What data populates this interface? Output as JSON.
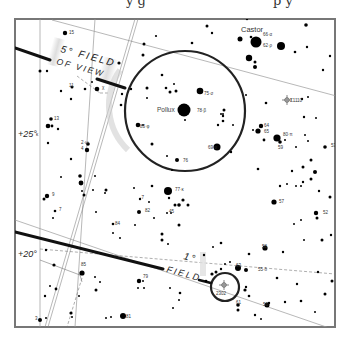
{
  "caption_fragment": {
    "left": "y g",
    "right": "p y"
  },
  "frame": {
    "x": 15,
    "y": 19,
    "width": 320,
    "height": 308,
    "border_color": "#777777"
  },
  "declination_labels": [
    {
      "label": "+25°",
      "x": 18,
      "y": 135
    },
    {
      "label": "+20°",
      "x": 18,
      "y": 255
    }
  ],
  "fov_labels": {
    "five_deg": {
      "line1": "5° FIELD",
      "line2": "OF VIEW"
    },
    "one_deg": {
      "line1": "1°",
      "line2": "FIELD"
    }
  },
  "circles": {
    "five_deg": {
      "cx": 185,
      "cy": 111,
      "r": 60,
      "color": "#222222"
    },
    "one_deg": {
      "cx": 225,
      "cy": 287,
      "r": 14,
      "color": "#222222"
    }
  },
  "named_stars": [
    {
      "name": "Castor",
      "id": "66-α",
      "x": 256,
      "y": 42,
      "r": 5.5
    },
    {
      "name": "Pollux",
      "id": "78-β",
      "x": 184,
      "y": 110,
      "r": 6.5
    }
  ],
  "star_labels": [
    {
      "label": "66·α",
      "x": 263,
      "y": 36
    },
    {
      "label": "62·ρ",
      "x": 263,
      "y": 47
    },
    {
      "label": "75·σ",
      "x": 204,
      "y": 95
    },
    {
      "label": "78·β",
      "x": 197,
      "y": 112
    },
    {
      "label": "83·φ",
      "x": 140,
      "y": 128
    },
    {
      "label": "69·υ",
      "x": 208,
      "y": 149
    },
    {
      "label": "76",
      "x": 183,
      "y": 162
    },
    {
      "label": "77·κ",
      "x": 175,
      "y": 191
    },
    {
      "label": "64",
      "x": 264,
      "y": 127
    },
    {
      "label": "65",
      "x": 264,
      "y": 133
    },
    {
      "label": "80·π",
      "x": 283,
      "y": 136
    },
    {
      "label": "59",
      "x": 278,
      "y": 149
    },
    {
      "label": "53",
      "x": 331,
      "y": 147
    },
    {
      "label": "57",
      "x": 279,
      "y": 203
    },
    {
      "label": "52",
      "x": 323,
      "y": 214
    },
    {
      "label": "15",
      "x": 69,
      "y": 34
    },
    {
      "label": "χ",
      "x": 102,
      "y": 89
    },
    {
      "label": "11",
      "x": 69,
      "y": 87
    },
    {
      "label": "13",
      "x": 54,
      "y": 120
    },
    {
      "label": "κ",
      "x": 36,
      "y": 136
    },
    {
      "label": "2·ω",
      "x": 81,
      "y": 144
    },
    {
      "label": "4",
      "x": 81,
      "y": 150
    },
    {
      "label": "9",
      "x": 52,
      "y": 196
    },
    {
      "label": "7",
      "x": 59,
      "y": 211
    },
    {
      "label": "84",
      "x": 115,
      "y": 225
    },
    {
      "label": "82",
      "x": 145,
      "y": 212
    },
    {
      "label": "45",
      "x": 169,
      "y": 213
    },
    {
      "label": "·7",
      "x": 140,
      "y": 199
    },
    {
      "label": "85",
      "x": 81,
      "y": 266
    },
    {
      "label": "79",
      "x": 143,
      "y": 278
    },
    {
      "label": "81",
      "x": 126,
      "y": 318
    },
    {
      "label": "3",
      "x": 35,
      "y": 320
    },
    {
      "label": "58",
      "x": 262,
      "y": 248
    },
    {
      "label": "63",
      "x": 236,
      "y": 267
    },
    {
      "label": "55·δ",
      "x": 258,
      "y": 271
    },
    {
      "label": "2302",
      "x": 216,
      "y": 295
    },
    {
      "label": "61",
      "x": 236,
      "y": 304
    },
    {
      "label": "56",
      "x": 263,
      "y": 306
    },
    {
      "label": "Σ1110",
      "x": 290,
      "y": 102
    }
  ],
  "special_objects": [
    {
      "type": "nova-marker",
      "label": "Σ1110",
      "x": 287,
      "y": 100
    },
    {
      "type": "nova-marker",
      "label": "2302",
      "x": 224,
      "y": 285
    }
  ],
  "stars": [
    [
      65,
      33,
      2.2
    ],
    [
      144,
      44,
      1.5
    ],
    [
      240,
      39,
      2.5
    ],
    [
      256,
      42,
      5.5
    ],
    [
      281,
      46,
      4
    ],
    [
      251,
      37,
      1.3
    ],
    [
      212,
      33,
      1.2
    ],
    [
      306,
      25,
      1.8
    ],
    [
      192,
      43,
      1.3
    ],
    [
      295,
      52,
      1.3
    ],
    [
      307,
      47,
      1.2
    ],
    [
      249,
      58,
      3.2
    ],
    [
      255,
      62,
      1.5
    ],
    [
      255,
      67,
      2
    ],
    [
      207,
      26,
      1.5
    ],
    [
      247,
      19,
      1.2
    ],
    [
      156,
      36,
      1.1
    ],
    [
      143,
      55,
      1.5
    ],
    [
      119,
      63,
      1.6
    ],
    [
      97,
      89,
      2.3
    ],
    [
      85,
      89,
      1.3
    ],
    [
      72,
      87,
      1.5
    ],
    [
      61,
      91,
      1.2
    ],
    [
      71,
      99,
      1.2
    ],
    [
      92,
      82,
      1
    ],
    [
      122,
      94,
      1.2
    ],
    [
      47,
      71,
      1.2
    ],
    [
      40,
      71,
      1.5
    ],
    [
      131,
      89,
      1.2
    ],
    [
      121,
      105,
      1.3
    ],
    [
      162,
      75,
      1.3
    ],
    [
      166,
      88,
      1.3
    ],
    [
      170,
      92,
      1.5
    ],
    [
      176,
      91,
      1.5
    ],
    [
      174,
      84,
      1
    ],
    [
      147,
      88,
      1.5
    ],
    [
      147,
      98,
      1
    ],
    [
      200,
      91,
      3.3
    ],
    [
      184,
      110,
      6.5
    ],
    [
      138,
      125,
      2.3
    ],
    [
      185,
      120,
      1
    ],
    [
      152,
      144,
      1.5
    ],
    [
      224,
      110,
      1.5
    ],
    [
      223,
      121,
      1.3
    ],
    [
      223,
      116,
      1.2
    ],
    [
      223,
      114,
      1
    ],
    [
      221,
      114,
      1
    ],
    [
      143,
      125,
      1
    ],
    [
      217,
      147,
      3.5
    ],
    [
      177,
      160,
      2
    ],
    [
      172,
      170,
      1
    ],
    [
      167,
      156,
      1
    ],
    [
      51,
      119,
      1.8
    ],
    [
      48,
      126,
      2.3
    ],
    [
      52,
      126,
      1.4
    ],
    [
      58,
      129,
      1.2
    ],
    [
      48,
      143,
      1.2
    ],
    [
      88,
      144,
      1.8
    ],
    [
      87,
      150,
      2.2
    ],
    [
      71,
      159,
      1.2
    ],
    [
      61,
      177,
      1
    ],
    [
      80,
      176,
      1.8
    ],
    [
      81,
      183,
      2.4
    ],
    [
      84,
      195,
      1.5
    ],
    [
      47,
      196,
      2.2
    ],
    [
      44,
      199,
      1.5
    ],
    [
      55,
      211,
      1.3
    ],
    [
      53,
      218,
      1
    ],
    [
      95,
      176,
      1
    ],
    [
      106,
      190,
      1.5
    ],
    [
      105,
      193,
      1
    ],
    [
      96,
      212,
      1
    ],
    [
      113,
      224,
      1.3
    ],
    [
      134,
      188,
      1
    ],
    [
      140,
      199,
      1.2
    ],
    [
      139,
      212,
      2
    ],
    [
      152,
      186,
      1.3
    ],
    [
      168,
      191,
      4
    ],
    [
      169,
      198,
      1.2
    ],
    [
      149,
      202,
      1
    ],
    [
      167,
      213,
      1
    ],
    [
      171,
      213,
      1
    ],
    [
      154,
      218,
      1
    ],
    [
      179,
      225,
      1.5
    ],
    [
      162,
      234,
      1.5
    ],
    [
      162,
      240,
      1.5
    ],
    [
      168,
      244,
      1
    ],
    [
      113,
      233,
      1
    ],
    [
      82,
      191,
      1
    ],
    [
      93,
      190,
      1
    ],
    [
      135,
      225,
      1
    ],
    [
      120,
      238,
      1
    ],
    [
      261,
      126,
      2.2
    ],
    [
      258,
      131,
      2.6
    ],
    [
      253,
      130,
      1
    ],
    [
      264,
      140,
      1.4
    ],
    [
      277,
      138,
      3.6
    ],
    [
      280,
      142,
      1.8
    ],
    [
      285,
      140,
      1
    ],
    [
      305,
      135,
      1
    ],
    [
      325,
      147,
      1.8
    ],
    [
      296,
      147,
      1
    ],
    [
      233,
      125,
      1
    ],
    [
      231,
      152,
      1.2
    ],
    [
      218,
      125,
      1.2
    ],
    [
      302,
      99,
      1.2
    ],
    [
      308,
      97,
      1
    ],
    [
      304,
      117,
      1.2
    ],
    [
      266,
      103,
      1.3
    ],
    [
      246,
      95,
      1
    ],
    [
      323,
      70,
      1.2
    ],
    [
      330,
      56,
      1.2
    ],
    [
      316,
      118,
      1
    ],
    [
      308,
      141,
      1
    ],
    [
      175,
      205,
      1.5
    ],
    [
      188,
      205,
      1.5
    ],
    [
      179,
      205,
      1.8
    ],
    [
      183,
      200,
      1.6
    ],
    [
      258,
      169,
      1.3
    ],
    [
      311,
      160,
      1.5
    ],
    [
      303,
      167,
      1.5
    ],
    [
      315,
      172,
      2
    ],
    [
      292,
      171,
      1.2
    ],
    [
      311,
      179,
      1.5
    ],
    [
      303,
      182,
      1.2
    ],
    [
      296,
      186,
      1
    ],
    [
      287,
      184,
      1
    ],
    [
      301,
      186,
      1
    ],
    [
      280,
      186,
      1.2
    ],
    [
      319,
      191,
      1.2
    ],
    [
      330,
      197,
      1.5
    ],
    [
      274,
      202,
      2.6
    ],
    [
      316,
      213,
      2.2
    ],
    [
      317,
      218,
      1.5
    ],
    [
      301,
      220,
      1
    ],
    [
      304,
      240,
      1
    ],
    [
      331,
      235,
      1.2
    ],
    [
      294,
      224,
      1
    ],
    [
      322,
      240,
      1.5
    ],
    [
      54,
      265,
      1.6
    ],
    [
      82,
      273,
      2.6
    ],
    [
      46,
      250,
      1.2
    ],
    [
      56,
      289,
      1.4
    ],
    [
      50,
      286,
      1
    ],
    [
      79,
      296,
      1
    ],
    [
      45,
      296,
      1.2
    ],
    [
      96,
      290,
      1.5
    ],
    [
      95,
      277,
      1
    ],
    [
      40,
      320,
      2
    ],
    [
      71,
      313,
      1.6
    ],
    [
      72,
      317,
      1
    ],
    [
      46,
      318,
      1
    ],
    [
      123,
      316,
      3
    ],
    [
      106,
      318,
      1
    ],
    [
      111,
      317,
      1
    ],
    [
      139,
      281,
      2.2
    ],
    [
      143,
      281,
      1
    ],
    [
      144,
      288,
      1
    ],
    [
      138,
      288,
      1
    ],
    [
      170,
      288,
      1
    ],
    [
      180,
      293,
      1.3
    ],
    [
      179,
      300,
      1
    ],
    [
      173,
      308,
      1
    ],
    [
      100,
      282,
      1
    ],
    [
      206,
      281,
      1.3
    ],
    [
      212,
      274,
      1.6
    ],
    [
      216,
      272,
      1.5
    ],
    [
      238,
      268,
      3
    ],
    [
      246,
      270,
      2
    ],
    [
      221,
      269,
      1.2
    ],
    [
      225,
      264,
      1
    ],
    [
      230,
      262,
      1
    ],
    [
      249,
      254,
      1.3
    ],
    [
      265,
      248,
      2.6
    ],
    [
      245,
      290,
      1.6
    ],
    [
      249,
      296,
      1.3
    ],
    [
      238,
      305,
      1.8
    ],
    [
      238,
      310,
      1.5
    ],
    [
      255,
      315,
      1.2
    ],
    [
      267,
      305,
      2.5
    ],
    [
      269,
      303,
      1.2
    ],
    [
      297,
      284,
      1.2
    ],
    [
      318,
      272,
      1.2
    ],
    [
      332,
      281,
      1.5
    ],
    [
      325,
      294,
      1.5
    ],
    [
      285,
      302,
      1.2
    ],
    [
      315,
      312,
      1
    ],
    [
      301,
      301,
      1.3
    ],
    [
      283,
      252,
      1.2
    ],
    [
      277,
      278,
      1.3
    ],
    [
      246,
      287,
      1.2
    ],
    [
      261,
      319,
      1
    ],
    [
      221,
      243,
      1.3
    ],
    [
      213,
      247,
      1
    ],
    [
      204,
      255,
      1.2
    ]
  ],
  "grid_lines": [
    {
      "x1": 52,
      "y1": 20,
      "x2": 340,
      "y2": 97,
      "style": "thin"
    },
    {
      "x1": 15,
      "y1": 220,
      "x2": 335,
      "y2": 330,
      "style": "thin"
    },
    {
      "x1": 40,
      "y1": 19,
      "x2": 40,
      "y2": 327,
      "style": "thin"
    },
    {
      "x1": 95,
      "y1": 19,
      "x2": 75,
      "y2": 327,
      "style": "thin"
    },
    {
      "x1": 135,
      "y1": 19,
      "x2": 45,
      "y2": 327,
      "style": "double"
    }
  ],
  "constellation_lines": [
    {
      "x1": 40,
      "y1": 249,
      "x2": 335,
      "y2": 274,
      "style": "dashed"
    },
    {
      "x1": 77,
      "y1": 76,
      "x2": 100,
      "y2": 93,
      "style": "dashed"
    },
    {
      "x1": 100,
      "y1": 93,
      "x2": 110,
      "y2": 93,
      "style": "dashed"
    },
    {
      "x1": 40,
      "y1": 260,
      "x2": 80,
      "y2": 275,
      "style": "thin"
    },
    {
      "x1": 80,
      "y1": 275,
      "x2": 82,
      "y2": 282,
      "style": "thin"
    },
    {
      "x1": 82,
      "y1": 278,
      "x2": 67,
      "y2": 327,
      "style": "dashed"
    }
  ],
  "pointer_lines": [
    {
      "x1": 15,
      "y1": 48,
      "x2": 50,
      "y2": 60,
      "width": 3
    },
    {
      "x1": 97,
      "y1": 79,
      "x2": 125,
      "y2": 88,
      "width": 3
    },
    {
      "x1": 15,
      "y1": 232,
      "x2": 163,
      "y2": 269,
      "width": 3
    },
    {
      "x1": 199,
      "y1": 280,
      "x2": 211,
      "y2": 283,
      "width": 2.5
    }
  ]
}
